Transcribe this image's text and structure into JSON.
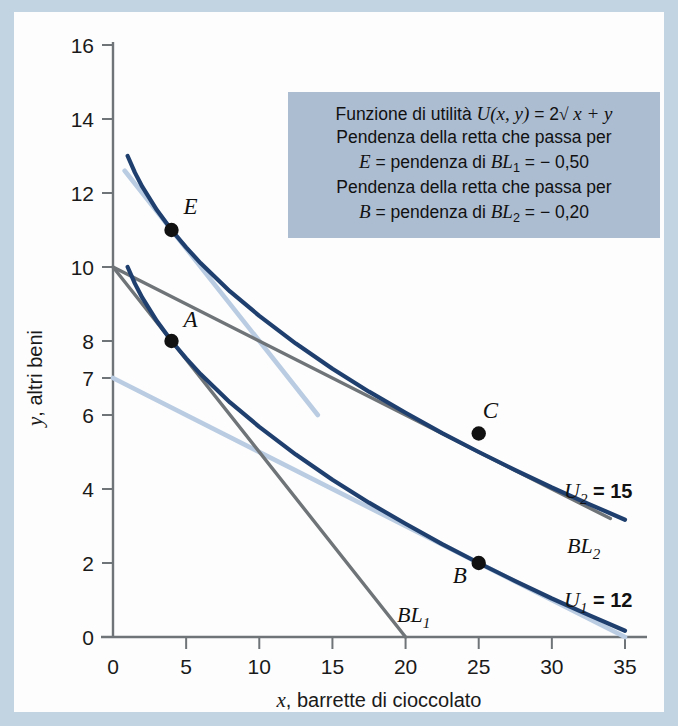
{
  "figure": {
    "frame_color": "#c2d3e2",
    "paper_color": "#fdfdfd"
  },
  "annotation": {
    "name": "utility-annotation-box",
    "background": "#adbdd1",
    "line1_pre": "Funzione di utilità ",
    "line1_fn": "U",
    "line1_args": "(x, y)",
    "line1_eq": " = 2",
    "line1_radical": "√",
    "line1_tail": " x + y",
    "line2": "Pendenza della retta che passa per",
    "line3_e": "E",
    "line3_mid": " = pendenza di ",
    "line3_bl": "BL",
    "line3_sub": "1",
    "line3_val": " = − 0,50",
    "line4": "Pendenza della retta che passa per",
    "line5_b": "B",
    "line5_mid": " = pendenza di ",
    "line5_bl": "BL",
    "line5_sub": "2",
    "line5_val": " = − 0,20"
  },
  "chart_data": {
    "type": "line",
    "title": "",
    "xlabel_italic": "x",
    "xlabel": ", barrette di cioccolato",
    "ylabel_italic": "y",
    "ylabel": ", altri beni",
    "xlim": [
      0,
      35
    ],
    "ylim": [
      0,
      16
    ],
    "xticks": [
      0,
      5,
      10,
      15,
      20,
      25,
      30,
      35
    ],
    "yticks": [
      0,
      2,
      4,
      6,
      7,
      8,
      10,
      12,
      14,
      16
    ],
    "grid": false,
    "legend_position": "inline-right",
    "colors": {
      "indifference_curve": "#1f3f6e",
      "budget_line_light": "#b9cce2",
      "budget_line_gray": "#6f7478",
      "point": "#111111",
      "axis": "#6f7478"
    },
    "series": [
      {
        "name": "U2",
        "label": "U",
        "label_sub": "2",
        "label_value": " = 15",
        "type": "indifference-curve",
        "color": "#1f3f6e",
        "formula": "y = 15 - 2*sqrt(x)",
        "points": [
          [
            1.0,
            13.0
          ],
          [
            1.5,
            12.55
          ],
          [
            2.0,
            12.17
          ],
          [
            3.0,
            11.54
          ],
          [
            4.0,
            11.0
          ],
          [
            5.0,
            10.53
          ],
          [
            6.0,
            10.1
          ],
          [
            8.0,
            9.34
          ],
          [
            10.0,
            8.68
          ],
          [
            12.5,
            7.93
          ],
          [
            15.0,
            7.25
          ],
          [
            17.5,
            6.63
          ],
          [
            20.0,
            6.06
          ],
          [
            22.5,
            5.51
          ],
          [
            25.0,
            5.0
          ],
          [
            27.5,
            4.51
          ],
          [
            30.0,
            4.04
          ],
          [
            32.5,
            3.6
          ],
          [
            35.0,
            3.17
          ]
        ],
        "anchor_points": [
          [
            4,
            11
          ],
          [
            25,
            5.5
          ]
        ]
      },
      {
        "name": "U1",
        "label": "U",
        "label_sub": "1",
        "label_value": " = 12",
        "type": "indifference-curve",
        "color": "#1f3f6e",
        "formula": "y = 12 - 2*sqrt(x)",
        "points": [
          [
            1.0,
            10.0
          ],
          [
            1.5,
            9.55
          ],
          [
            2.0,
            9.17
          ],
          [
            3.0,
            8.54
          ],
          [
            4.0,
            8.0
          ],
          [
            5.0,
            7.53
          ],
          [
            6.0,
            7.1
          ],
          [
            8.0,
            6.34
          ],
          [
            10.0,
            5.68
          ],
          [
            12.5,
            4.93
          ],
          [
            15.0,
            4.25
          ],
          [
            17.5,
            3.63
          ],
          [
            20.0,
            3.06
          ],
          [
            22.5,
            2.51
          ],
          [
            25.0,
            2.0
          ],
          [
            27.5,
            1.51
          ],
          [
            30.0,
            1.04
          ],
          [
            32.5,
            0.6
          ],
          [
            35.0,
            0.17
          ]
        ],
        "anchor_points": [
          [
            4,
            8
          ],
          [
            25,
            2
          ]
        ]
      },
      {
        "name": "BL1",
        "label": "BL",
        "label_sub": "1",
        "label_value": "",
        "type": "budget-line",
        "color": "#6f7478",
        "slope": -0.5,
        "intercept": 10,
        "from": [
          0,
          10
        ],
        "to": [
          20,
          0
        ]
      },
      {
        "name": "BL2",
        "label": "BL",
        "label_sub": "2",
        "label_value": "",
        "type": "budget-line",
        "color": "#6f7478",
        "slope": -0.2,
        "intercept": 10,
        "from": [
          0,
          10
        ],
        "to": [
          34,
          3.2
        ]
      },
      {
        "name": "tangent-at-E",
        "type": "tangent-line",
        "color": "#b9cce2",
        "slope": -0.5,
        "intercept": 13,
        "from": [
          0.8,
          12.6
        ],
        "to": [
          14,
          6.0
        ]
      },
      {
        "name": "tangent-at-B",
        "type": "tangent-line",
        "color": "#b9cce2",
        "slope": -0.2,
        "intercept": 7,
        "from": [
          0,
          7
        ],
        "to": [
          35,
          0
        ]
      }
    ],
    "points": [
      {
        "name": "A",
        "label": "A",
        "x": 4,
        "y": 8,
        "label_dx": 12,
        "label_dy": -14
      },
      {
        "name": "E",
        "label": "E",
        "x": 4,
        "y": 11,
        "label_dx": 12,
        "label_dy": -16
      },
      {
        "name": "B",
        "label": "B",
        "x": 25,
        "y": 2,
        "label_dx": -26,
        "label_dy": 20
      },
      {
        "name": "C",
        "label": "C",
        "x": 25,
        "y": 5.5,
        "label_dx": 4,
        "label_dy": -16
      }
    ]
  }
}
